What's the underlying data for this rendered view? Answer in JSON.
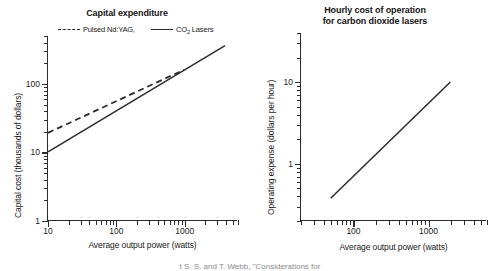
{
  "caption_partial": "t     S. S.   and T. Webb, \"Considerations for",
  "chart_data": [
    {
      "type": "line",
      "title": "Capital expenditure",
      "xlabel": "Average output power (watts)",
      "ylabel": "Capital cost (thousands of dollars)",
      "xscale": "log",
      "yscale": "log",
      "xlim": [
        10,
        6000
      ],
      "ylim": [
        1,
        500
      ],
      "xticks": [
        10,
        100,
        1000
      ],
      "xticklabels": [
        "10",
        "100",
        "1000"
      ],
      "yticks": [
        1,
        10,
        100
      ],
      "yticklabels": [
        "1",
        "10",
        "100"
      ],
      "grid": false,
      "legend_position": "above-axes",
      "series": [
        {
          "name": "Pulsed Nd:YAG,",
          "style": "dashed",
          "color": "#2b2b2b",
          "x": [
            10,
            1000
          ],
          "y": [
            19,
            160
          ]
        },
        {
          "name": "CO2 Lasers",
          "style": "solid",
          "color": "#2b2b2b",
          "x": [
            10,
            4000
          ],
          "y": [
            10,
            360
          ]
        }
      ]
    },
    {
      "type": "line",
      "title_line1": "Hourly cost of operation",
      "title_line2": "for carbon dioxide lasers",
      "xlabel": "Average output power (watts)",
      "ylabel": "Operating expense (dollars per hour)",
      "xscale": "log",
      "yscale": "log",
      "xlim": [
        20,
        6000
      ],
      "ylim": [
        0.2,
        40
      ],
      "xticks": [
        100,
        1000
      ],
      "xticklabels": [
        "100",
        "1000"
      ],
      "yticks": [
        1,
        10
      ],
      "yticklabels": [
        "1",
        "10"
      ],
      "grid": false,
      "series": [
        {
          "name": "Operating expense",
          "style": "solid",
          "color": "#2b2b2b",
          "x": [
            50,
            2000
          ],
          "y": [
            0.37,
            10
          ]
        }
      ]
    }
  ]
}
